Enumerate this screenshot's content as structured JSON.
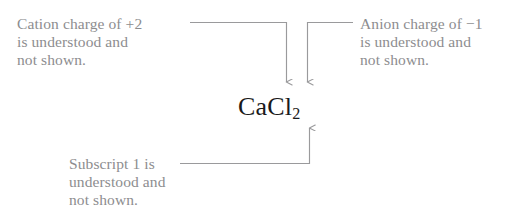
{
  "figure": {
    "background_color": "#ffffff",
    "text_color": "#8d8d8f",
    "line_color": "#9a9a9c",
    "formula_color": "#1a1a1a",
    "width": 527,
    "height": 220
  },
  "formula": {
    "base_left": "CaCl",
    "subscript": "2",
    "full": "CaCl2",
    "display": "CaCl₂"
  },
  "annotations": {
    "cation": {
      "text": "Cation charge of +2\nis understood and\nnot shown.",
      "lines": [
        "Cation charge of +2",
        "is understood and",
        "not shown."
      ],
      "points_to": "Ca",
      "arrow_direction": "down"
    },
    "anion": {
      "text": "Anion charge of −1\nis understood and\nnot shown.",
      "lines": [
        "Anion charge of −1",
        "is understood and",
        "not shown."
      ],
      "points_to": "Cl",
      "arrow_direction": "down"
    },
    "subscript": {
      "text": "Subscript 1 is\nunderstood and\nnot shown.",
      "lines": [
        "Subscript 1 is",
        "understood and",
        "not shown."
      ],
      "points_to": "Ca subscript",
      "arrow_direction": "up"
    }
  }
}
